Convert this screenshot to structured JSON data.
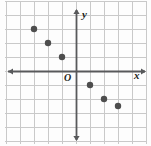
{
  "figure": {
    "kind": "coordinate-plane-scatter",
    "width_px": 151,
    "height_px": 146,
    "background_color": "#fdfdfd",
    "grid_color": "#c9c9c9",
    "axis_color": "#58595b",
    "point_color": "#4d4d4d",
    "label_color": "#231f20"
  },
  "labels": {
    "y_axis": "y",
    "x_axis": "x",
    "origin": "O"
  },
  "chart_data": {
    "type": "scatter",
    "title": "",
    "xlabel": "x",
    "ylabel": "y",
    "grid": true,
    "legend": null,
    "origin_label": "O",
    "xlim": [
      -5,
      5
    ],
    "ylim": [
      -5,
      5
    ],
    "xticks": [
      -5,
      -4,
      -3,
      -2,
      -1,
      0,
      1,
      2,
      3,
      4,
      5
    ],
    "yticks": [
      -5,
      -4,
      -3,
      -2,
      -1,
      0,
      1,
      2,
      3,
      4,
      5
    ],
    "tick_labels_shown": false,
    "points": [
      {
        "x": -3,
        "y": 3
      },
      {
        "x": -2,
        "y": 2
      },
      {
        "x": -1,
        "y": 1
      },
      {
        "x": 1,
        "y": -1
      },
      {
        "x": 2,
        "y": -2
      },
      {
        "x": 3,
        "y": -2.5
      }
    ]
  },
  "geometry": {
    "origin_px": {
      "x": 76,
      "y": 71
    },
    "unit_px": 14,
    "point_radius_px": 3.2,
    "grid_lines_x_px": [
      6,
      20,
      34,
      48,
      62,
      76,
      90,
      104,
      118,
      132,
      146
    ],
    "grid_lines_y_px": [
      1,
      15,
      29,
      43,
      57,
      71,
      85,
      99,
      113,
      127,
      141
    ]
  }
}
